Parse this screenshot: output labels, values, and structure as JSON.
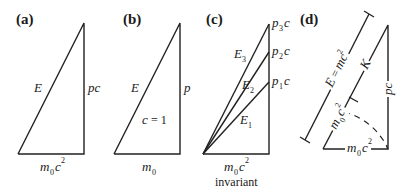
{
  "figure": {
    "panels": [
      {
        "id": "a",
        "label": "(a)",
        "hypotenuse": "E",
        "vertical_side": "pc",
        "base": {
          "main": "m",
          "sub": "0",
          "tail": "c",
          "sup": "2"
        }
      },
      {
        "id": "b",
        "label": "(b)",
        "hypotenuse": "E",
        "vertical_side": "p",
        "inner_note": {
          "var": "c",
          "rest": " = 1"
        },
        "base": {
          "main": "m",
          "sub": "0"
        }
      },
      {
        "id": "c",
        "label": "(c)",
        "hypotenuses": [
          {
            "main": "E",
            "sub": "1"
          },
          {
            "main": "E",
            "sub": "2"
          },
          {
            "main": "E",
            "sub": "3"
          }
        ],
        "vertical_marks": [
          {
            "main": "p",
            "sub": "1",
            "tail": "c"
          },
          {
            "main": "p",
            "sub": "2",
            "tail": "c"
          },
          {
            "main": "p",
            "sub": "3",
            "tail": "c"
          }
        ],
        "base": {
          "main": "m",
          "sub": "0",
          "tail": "c",
          "sup": "2"
        },
        "caption": "invariant"
      },
      {
        "id": "d",
        "label": "(d)",
        "total_energy": {
          "lhs": "E",
          "eq": " = ",
          "main": "mc",
          "sup": "2"
        },
        "kinetic": "K",
        "rest_segment": {
          "main": "m",
          "sub": "0",
          "tail": "c",
          "sup": "2"
        },
        "vertical_side": "pc",
        "base": {
          "main": "m",
          "sub": "0",
          "tail": "c",
          "sup": "2"
        }
      }
    ]
  }
}
